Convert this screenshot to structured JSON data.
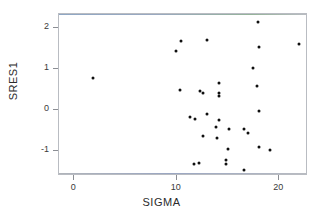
{
  "chart_data": {
    "type": "scatter",
    "title": "",
    "xlabel": "SIGMA",
    "ylabel": "SRES1",
    "xlim": [
      -1.5,
      22.8
    ],
    "ylim": [
      -1.62,
      2.33
    ],
    "xticks": [
      0,
      10,
      20
    ],
    "xtick_labels": [
      "0",
      "10",
      "20"
    ],
    "yticks": [
      -1,
      0,
      1,
      2
    ],
    "ytick_labels": [
      "-1",
      "0",
      "1",
      "2"
    ],
    "grid": false,
    "legend": false,
    "marker": "filled-circle",
    "marker_color": "#101010",
    "frame_color": "#b9bcc2",
    "background_color": "#ffffff",
    "series": [
      {
        "name": "SRES1 vs SIGMA",
        "points": [
          {
            "x": 1.8,
            "y": 0.78
          },
          {
            "x": 9.9,
            "y": 1.42
          },
          {
            "x": 10.4,
            "y": 1.68
          },
          {
            "x": 12.9,
            "y": 1.69
          },
          {
            "x": 17.9,
            "y": 2.14
          },
          {
            "x": 18.0,
            "y": 1.53
          },
          {
            "x": 21.9,
            "y": 1.6
          },
          {
            "x": 17.4,
            "y": 1.02
          },
          {
            "x": 10.3,
            "y": 0.47
          },
          {
            "x": 12.3,
            "y": 0.45
          },
          {
            "x": 12.6,
            "y": 0.4
          },
          {
            "x": 14.1,
            "y": 0.64
          },
          {
            "x": 14.1,
            "y": 0.4
          },
          {
            "x": 14.1,
            "y": 0.33
          },
          {
            "x": 17.8,
            "y": 0.57
          },
          {
            "x": 18.0,
            "y": -0.03
          },
          {
            "x": 11.3,
            "y": -0.18
          },
          {
            "x": 11.8,
            "y": -0.22
          },
          {
            "x": 12.9,
            "y": -0.11
          },
          {
            "x": 14.1,
            "y": -0.26
          },
          {
            "x": 13.8,
            "y": -0.43
          },
          {
            "x": 15.1,
            "y": -0.47
          },
          {
            "x": 16.6,
            "y": -0.47
          },
          {
            "x": 16.9,
            "y": -0.56
          },
          {
            "x": 12.6,
            "y": -0.65
          },
          {
            "x": 13.9,
            "y": -0.69
          },
          {
            "x": 15.0,
            "y": -0.97
          },
          {
            "x": 18.0,
            "y": -0.91
          },
          {
            "x": 19.1,
            "y": -0.99
          },
          {
            "x": 11.7,
            "y": -1.32
          },
          {
            "x": 12.2,
            "y": -1.31
          },
          {
            "x": 14.8,
            "y": -1.23
          },
          {
            "x": 14.8,
            "y": -1.33
          },
          {
            "x": 16.6,
            "y": -1.47
          }
        ]
      }
    ]
  },
  "axes": {
    "x_title": "SIGMA",
    "y_title": "SRES1"
  }
}
